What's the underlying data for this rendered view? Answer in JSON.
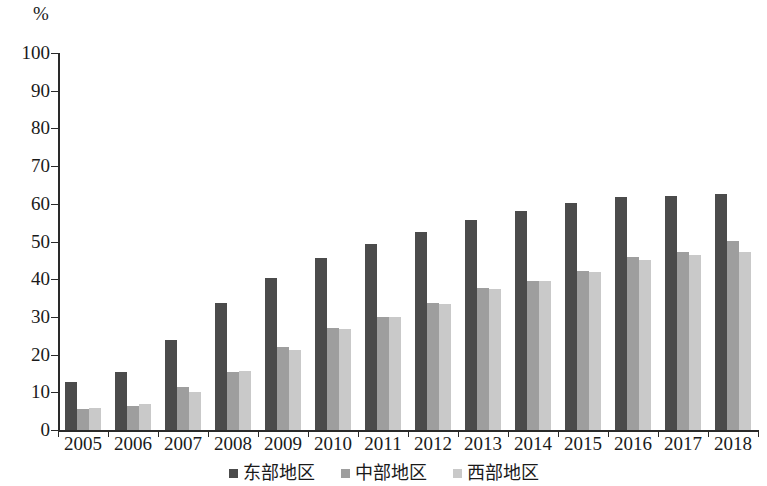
{
  "chart_data": {
    "type": "bar",
    "title": "",
    "subtitle": "",
    "xlabel": "",
    "ylabel": "",
    "unit_label": "%",
    "categories": [
      "2005",
      "2006",
      "2007",
      "2008",
      "2009",
      "2010",
      "2011",
      "2012",
      "2013",
      "2014",
      "2015",
      "2016",
      "2017",
      "2018"
    ],
    "series": [
      {
        "name": "东部地区",
        "color": "#4b4b4b",
        "values": [
          12.7,
          15.4,
          23.9,
          33.6,
          40.3,
          45.6,
          49.4,
          52.4,
          55.8,
          58.0,
          60.3,
          61.8,
          62.2,
          62.7
        ]
      },
      {
        "name": "中部地区",
        "color": "#9e9e9e",
        "values": [
          5.7,
          6.5,
          11.5,
          15.5,
          22.1,
          27.0,
          30.1,
          33.8,
          37.8,
          39.6,
          42.1,
          45.8,
          47.3,
          50.2
        ]
      },
      {
        "name": "西部地区",
        "color": "#c9c9c9",
        "values": [
          5.8,
          6.8,
          10.2,
          15.6,
          21.2,
          26.8,
          29.9,
          33.5,
          37.5,
          39.4,
          42.0,
          45.2,
          46.4,
          47.2
        ]
      }
    ],
    "ylim": [
      0,
      100
    ],
    "yticks": [
      0,
      10,
      20,
      30,
      40,
      50,
      60,
      70,
      80,
      90,
      100
    ],
    "ytick_labels": [
      "0",
      "10",
      "20",
      "30",
      "40",
      "50",
      "60",
      "70",
      "80",
      "90",
      "100"
    ],
    "grid": false,
    "legend_position": "bottom",
    "axis_color": "#2a2a2a"
  }
}
